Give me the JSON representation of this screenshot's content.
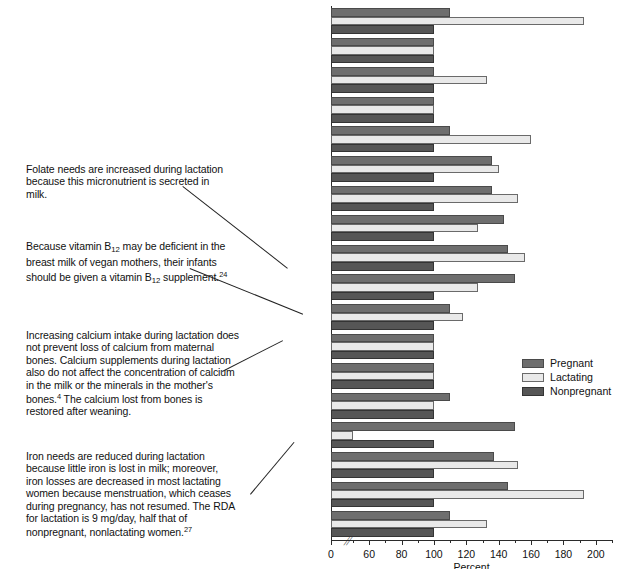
{
  "chart_data": {
    "type": "bar",
    "orientation": "horizontal",
    "title": "",
    "xlabel": "Percent",
    "ylabel": "",
    "xlim": [
      0,
      210
    ],
    "axis_break_after": 0,
    "grid": false,
    "legend_position": "right",
    "xticks": [
      0,
      60,
      80,
      100,
      120,
      140,
      160,
      180,
      200
    ],
    "categories": [
      "Vitamin A",
      "Vitamin D",
      "Vitamin E",
      "Vitamin K",
      "Vitamin C",
      "Thiamin",
      "Riboflavin",
      "Niacin",
      "Vitamin B6",
      "Folate",
      "Vitamin B12",
      "Calcium",
      "Phosphorus",
      "Magnesium",
      "Iron",
      "Zinc",
      "Iodine",
      "Selenium"
    ],
    "series": [
      {
        "name": "Pregnant",
        "color": "#6e6e6e",
        "values": [
          110,
          100,
          100,
          100,
          110,
          136,
          136,
          143,
          146,
          150,
          110,
          100,
          100,
          110,
          150,
          137,
          146,
          110
        ]
      },
      {
        "name": "Lactating",
        "color": "#e9e9e9",
        "values": [
          193,
          100,
          133,
          100,
          160,
          140,
          152,
          127,
          156,
          127,
          118,
          100,
          100,
          100,
          50,
          152,
          193,
          133
        ]
      },
      {
        "name": "Nonpregnant",
        "color": "#565656",
        "values": [
          100,
          100,
          100,
          100,
          100,
          100,
          100,
          100,
          100,
          100,
          100,
          100,
          100,
          100,
          100,
          100,
          100,
          100
        ]
      }
    ]
  },
  "legend": {
    "items": [
      {
        "label": "Pregnant"
      },
      {
        "label": "Lactating"
      },
      {
        "label": "Nonpregnant"
      }
    ]
  },
  "annotations": [
    {
      "id": "folate-note",
      "text": "Folate needs are increased during lactation because this micronutrient is secreted in milk.",
      "points_to": "Folate"
    },
    {
      "id": "b12-note",
      "html": "Because vitamin B<sub>12</sub> may be deficient in the breast milk of vegan mothers, their infants should be given a vitamin B<sub>12</sub> supplement.<sup>24</sup>",
      "points_to": "Vitamin B12"
    },
    {
      "id": "calcium-note",
      "html": "Increasing calcium intake during lactation does not prevent loss of calcium from maternal bones. Calcium supplements during lactation also do not affect the concentration of calcium in the milk or the minerals in the mother's bones.<sup>4</sup> The calcium lost from bones is restored after weaning.",
      "points_to": "Calcium"
    },
    {
      "id": "iron-note",
      "html": "Iron needs are reduced during lactation because little iron is lost in milk; moreover, iron losses are decreased in most lactating women because menstruation, which ceases during pregnancy, has not resumed. The RDA for lactation is 9 mg/day, half that of nonpregnant, nonlactating women.<sup>27</sup>",
      "points_to": "Iron"
    }
  ]
}
